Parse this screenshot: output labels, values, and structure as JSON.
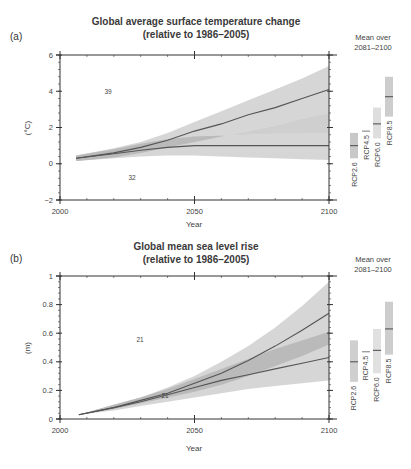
{
  "chart_data": [
    {
      "panel": "(a)",
      "type": "line",
      "title": "Global average surface temperature change",
      "subtitle": "(relative to 1986–2005)",
      "xlabel": "Year",
      "ylabel": "(°C)",
      "xlim": [
        2000,
        2100
      ],
      "ylim": [
        -2,
        6
      ],
      "xticks": [
        2000,
        2050,
        2100
      ],
      "yticks": [
        -2,
        0,
        2,
        4,
        6
      ],
      "grid": false,
      "series": [
        {
          "name": "RCP8.5",
          "model_count": "39",
          "x": [
            2006,
            2020,
            2030,
            2040,
            2050,
            2060,
            2070,
            2080,
            2090,
            2100
          ],
          "mean": [
            0.3,
            0.6,
            0.9,
            1.3,
            1.8,
            2.2,
            2.7,
            3.1,
            3.6,
            4.1
          ],
          "lower": [
            0.15,
            0.35,
            0.6,
            0.9,
            1.2,
            1.5,
            1.8,
            2.1,
            2.5,
            2.8
          ],
          "upper": [
            0.45,
            0.85,
            1.2,
            1.7,
            2.3,
            2.9,
            3.5,
            4.1,
            4.7,
            5.4
          ]
        },
        {
          "name": "RCP2.6",
          "model_count": "32",
          "x": [
            2006,
            2020,
            2030,
            2040,
            2050,
            2060,
            2070,
            2080,
            2090,
            2100
          ],
          "mean": [
            0.3,
            0.55,
            0.75,
            0.9,
            1.0,
            1.0,
            1.0,
            1.0,
            1.0,
            1.0
          ],
          "lower": [
            0.15,
            0.3,
            0.4,
            0.45,
            0.45,
            0.4,
            0.35,
            0.3,
            0.25,
            0.2
          ],
          "upper": [
            0.45,
            0.8,
            1.1,
            1.35,
            1.5,
            1.55,
            1.6,
            1.65,
            1.65,
            1.7
          ]
        }
      ],
      "legend_title": [
        "Mean over",
        "2081–2100"
      ],
      "bars": [
        {
          "name": "RCP2.6",
          "low": 0.3,
          "high": 1.7,
          "mean": 1.0,
          "color": "#c8c8c8"
        },
        {
          "name": "RCP4.5",
          "low": 1.8,
          "high": 1.8,
          "mean": 1.8,
          "color": "#d0d0d0"
        },
        {
          "name": "RCP6.0",
          "low": 1.4,
          "high": 3.1,
          "mean": 2.2,
          "color": "#dedede"
        },
        {
          "name": "RCP8.5",
          "low": 2.6,
          "high": 4.8,
          "mean": 3.7,
          "color": "#cdcdcd"
        }
      ]
    },
    {
      "panel": "(b)",
      "type": "line",
      "title": "Global mean sea level rise",
      "subtitle": "(relative to 1986–2005)",
      "xlabel": "Year",
      "ylabel": "(m)",
      "xlim": [
        2000,
        2100
      ],
      "ylim": [
        0,
        1
      ],
      "xticks": [
        2000,
        2050,
        2100
      ],
      "yticks": [
        0,
        0.2,
        0.4,
        0.6,
        0.8,
        1
      ],
      "grid": false,
      "series": [
        {
          "name": "RCP8.5",
          "model_count": "21",
          "x": [
            2007,
            2020,
            2030,
            2040,
            2050,
            2060,
            2070,
            2080,
            2090,
            2100
          ],
          "mean": [
            0.03,
            0.08,
            0.13,
            0.18,
            0.25,
            0.32,
            0.41,
            0.51,
            0.62,
            0.74
          ],
          "lower": [
            0.03,
            0.07,
            0.11,
            0.15,
            0.19,
            0.24,
            0.3,
            0.37,
            0.44,
            0.52
          ],
          "upper": [
            0.03,
            0.1,
            0.15,
            0.22,
            0.3,
            0.4,
            0.51,
            0.64,
            0.79,
            0.96
          ]
        },
        {
          "name": "RCP2.6",
          "model_count": "21",
          "x": [
            2007,
            2020,
            2030,
            2040,
            2050,
            2060,
            2070,
            2080,
            2090,
            2100
          ],
          "mean": [
            0.03,
            0.08,
            0.12,
            0.17,
            0.22,
            0.27,
            0.31,
            0.35,
            0.39,
            0.43
          ],
          "lower": [
            0.03,
            0.06,
            0.09,
            0.12,
            0.15,
            0.18,
            0.21,
            0.23,
            0.25,
            0.27
          ],
          "upper": [
            0.03,
            0.1,
            0.15,
            0.21,
            0.28,
            0.35,
            0.42,
            0.49,
            0.55,
            0.61
          ]
        }
      ],
      "legend_title": [
        "Mean over",
        "2081–2100"
      ],
      "bars": [
        {
          "name": "RCP2.6",
          "low": 0.26,
          "high": 0.55,
          "mean": 0.4,
          "color": "#cfcfcf"
        },
        {
          "name": "RCP4.5",
          "low": 0.47,
          "high": 0.47,
          "mean": 0.47,
          "color": "#d6d6d6"
        },
        {
          "name": "RCP6.0",
          "low": 0.32,
          "high": 0.63,
          "mean": 0.48,
          "color": "#e0e0e0"
        },
        {
          "name": "RCP8.5",
          "low": 0.45,
          "high": 0.82,
          "mean": 0.63,
          "color": "#cdcdcd"
        }
      ]
    }
  ],
  "colors": {
    "band": "#cfcfcf",
    "overlap": "#a8a8a8",
    "line": "#555555",
    "axis": "#333333",
    "bar_mean": "#555555"
  }
}
